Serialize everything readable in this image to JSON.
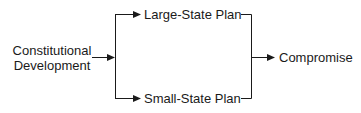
{
  "diagram": {
    "source": {
      "line1": "Constitutional",
      "line2": "Development"
    },
    "branches": [
      {
        "label": "Large-State Plan"
      },
      {
        "label": "Small-State Plan"
      }
    ],
    "result": {
      "label": "Compromise"
    },
    "colors": {
      "line": "#1a1a1a",
      "background": "#ffffff"
    }
  }
}
